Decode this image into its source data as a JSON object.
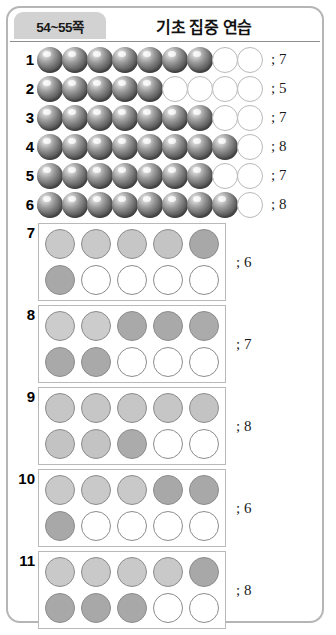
{
  "header": {
    "page_range": "54~55쪽",
    "title": "기초 집중 연습"
  },
  "sphere_rows": [
    {
      "number": "1",
      "filled": 7,
      "empty": 2,
      "answer": "; 7"
    },
    {
      "number": "2",
      "filled": 5,
      "empty": 4,
      "answer": "; 5"
    },
    {
      "number": "3",
      "filled": 7,
      "empty": 2,
      "answer": "; 7"
    },
    {
      "number": "4",
      "filled": 8,
      "empty": 1,
      "answer": "; 8"
    },
    {
      "number": "5",
      "filled": 7,
      "empty": 2,
      "answer": "; 7"
    },
    {
      "number": "6",
      "filled": 8,
      "empty": 1,
      "answer": "; 8"
    }
  ],
  "box_items": [
    {
      "number": "7",
      "answer": "; 6",
      "top_row": [
        "#c9c9c9",
        "#c9c9c9",
        "#c6c6c6",
        "#c4c4c4",
        "#a8a8a8"
      ],
      "bottom_row": [
        "#a8a8a8",
        "empty",
        "empty",
        "empty",
        "empty"
      ]
    },
    {
      "number": "8",
      "answer": "; 7",
      "top_row": [
        "#cccccc",
        "#cccccc",
        "#a9a9a9",
        "#a9a9a9",
        "#ababab"
      ],
      "bottom_row": [
        "#a9a9a9",
        "#a9a9a9",
        "empty",
        "empty",
        "empty"
      ]
    },
    {
      "number": "9",
      "answer": "; 8",
      "top_row": [
        "#c6c6c6",
        "#c6c6c6",
        "#c6c6c6",
        "#c6c6c6",
        "#c3c3c3"
      ],
      "bottom_row": [
        "#c3c3c3",
        "#c3c3c3",
        "#ababab",
        "empty",
        "empty"
      ]
    },
    {
      "number": "10",
      "answer": "; 6",
      "top_row": [
        "#c9c9c9",
        "#c9c9c9",
        "#c9c9c9",
        "#a8a8a8",
        "#a8a8a8"
      ],
      "bottom_row": [
        "#a8a8a8",
        "empty",
        "empty",
        "empty",
        "empty"
      ]
    },
    {
      "number": "11",
      "answer": "; 8",
      "top_row": [
        "#c9c9c9",
        "#c9c9c9",
        "#c9c9c9",
        "#c9c9c9",
        "#a8a8a8"
      ],
      "bottom_row": [
        "#a8a8a8",
        "#a8a8a8",
        "#a8a8a8",
        "empty",
        "empty"
      ]
    }
  ]
}
